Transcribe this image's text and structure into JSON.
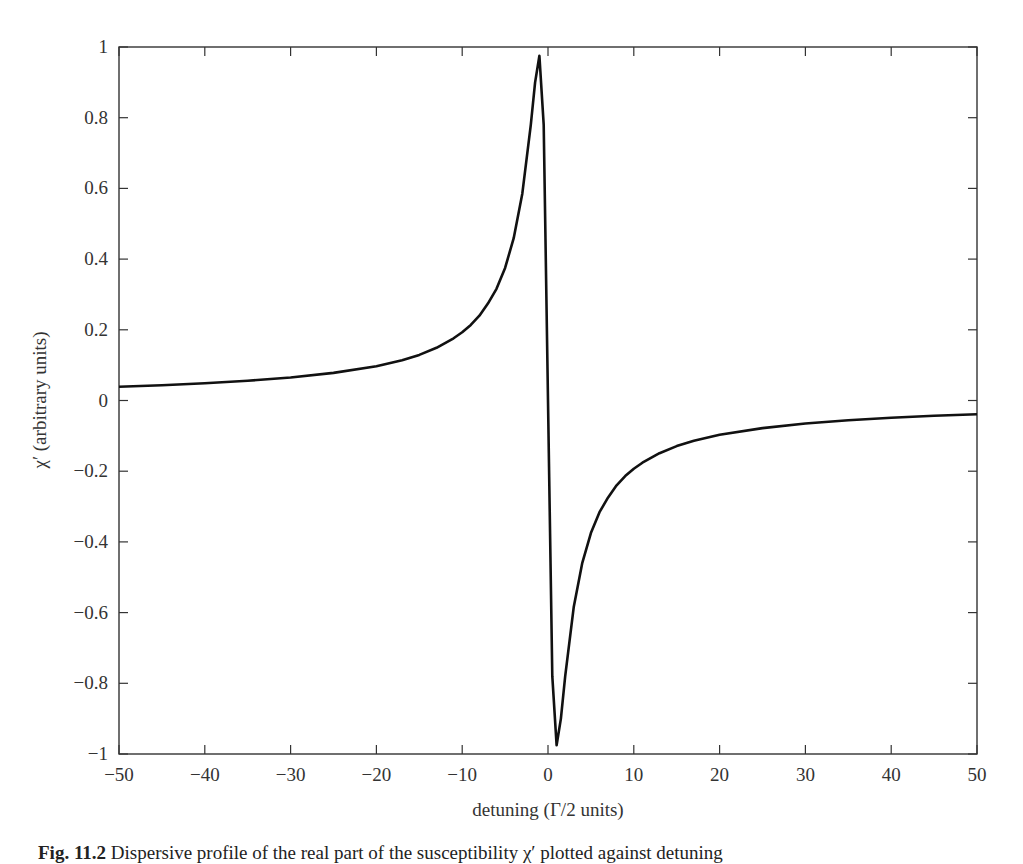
{
  "chart_data": {
    "type": "line",
    "title": "",
    "xlabel": "detuning (Γ/2 units)",
    "ylabel": "χ′ (arbitrary units)",
    "xlim": [
      -50,
      50
    ],
    "ylim": [
      -1,
      1
    ],
    "xticks": [
      -50,
      -40,
      -30,
      -20,
      -10,
      0,
      10,
      20,
      30,
      40,
      50
    ],
    "xtick_labels": [
      "−50",
      "−40",
      "−30",
      "−20",
      "−10",
      "0",
      "10",
      "20",
      "30",
      "40",
      "50"
    ],
    "yticks": [
      -1,
      -0.8,
      -0.6,
      -0.4,
      -0.2,
      0,
      0.2,
      0.4,
      0.6,
      0.8,
      1
    ],
    "ytick_labels": [
      "−1",
      "−0.8",
      "−0.6",
      "−0.4",
      "−0.2",
      "0",
      "0.2",
      "0.4",
      "0.6",
      "0.8",
      "1"
    ],
    "grid": false,
    "legend": null,
    "series": [
      {
        "name": "dispersion χ′",
        "color": "#111111",
        "x": [
          -50,
          -45,
          -40,
          -35,
          -30,
          -25,
          -20,
          -17,
          -15,
          -13,
          -11,
          -10,
          -9,
          -8,
          -7,
          -6,
          -5,
          -4,
          -3,
          -2,
          -1.5,
          -1,
          -0.5,
          0,
          0.5,
          1,
          1.5,
          2,
          3,
          4,
          5,
          6,
          7,
          8,
          9,
          10,
          11,
          13,
          15,
          17,
          20,
          25,
          30,
          35,
          40,
          45,
          50
        ],
        "values": [
          0.039,
          0.043,
          0.049,
          0.056,
          0.065,
          0.078,
          0.097,
          0.114,
          0.129,
          0.149,
          0.176,
          0.193,
          0.214,
          0.24,
          0.274,
          0.316,
          0.375,
          0.459,
          0.585,
          0.78,
          0.9,
          0.975,
          0.78,
          0.0,
          -0.78,
          -0.975,
          -0.9,
          -0.78,
          -0.585,
          -0.459,
          -0.375,
          -0.316,
          -0.274,
          -0.24,
          -0.214,
          -0.193,
          -0.176,
          -0.149,
          -0.129,
          -0.114,
          -0.097,
          -0.078,
          -0.065,
          -0.056,
          -0.049,
          -0.043,
          -0.039
        ]
      }
    ]
  },
  "caption": {
    "prefix": "Fig. 11.2",
    "text": "Dispersive profile of the real part of the susceptibility χ′ plotted against detuning"
  }
}
